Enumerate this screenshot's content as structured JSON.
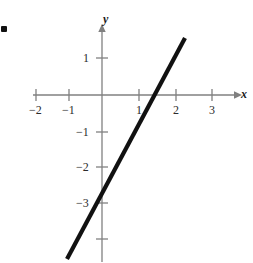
{
  "figure": {
    "bullet": "■",
    "background_color": "#ffffff",
    "axis_color": "#808080",
    "line_color": "#111111",
    "text_color": "#2b2b2b"
  },
  "axis_labels": {
    "x": "x",
    "y": "y"
  },
  "x_ticks": [
    {
      "value": -2,
      "label": "−2"
    },
    {
      "value": -1,
      "label": "−1"
    },
    {
      "value": 1,
      "label": "1"
    },
    {
      "value": 2,
      "label": "2"
    },
    {
      "value": 3,
      "label": "3"
    }
  ],
  "y_ticks": [
    {
      "value": 1,
      "label": "1"
    },
    {
      "value": -1,
      "label": "−1"
    },
    {
      "value": -2,
      "label": "−2"
    },
    {
      "value": -3,
      "label": "−3"
    },
    {
      "value": -4,
      "label": ""
    }
  ],
  "chart_data": {
    "type": "line",
    "title": "",
    "subtitle": "",
    "xlabel": "x",
    "ylabel": "y",
    "xlim": [
      -2.75,
      3.9
    ],
    "ylim": [
      -4.5,
      1.9
    ],
    "grid": false,
    "legend": null,
    "annotations": [],
    "x_tick_values": [
      -2,
      -1,
      1,
      2,
      3
    ],
    "x_tick_labels": [
      "−2",
      "−1",
      "1",
      "2",
      "3"
    ],
    "y_tick_values": [
      1,
      -1,
      -2,
      -3,
      -4
    ],
    "y_tick_labels": [
      "1",
      "−1",
      "−2",
      "−3",
      ""
    ],
    "series": [
      {
        "name": "line",
        "type": "line",
        "slope": 2,
        "intercept": -3,
        "equation": "y = 2x - 3",
        "color": "#111111",
        "width": 4,
        "x": [
          -0.95,
          2.25
        ],
        "values": [
          -4.9,
          1.5
        ],
        "endpoints": [
          {
            "x": -0.95,
            "y": -4.9
          },
          {
            "x": 2.25,
            "y": 1.5
          }
        ],
        "x_intercept": 1.5,
        "y_intercept": -3
      }
    ]
  }
}
